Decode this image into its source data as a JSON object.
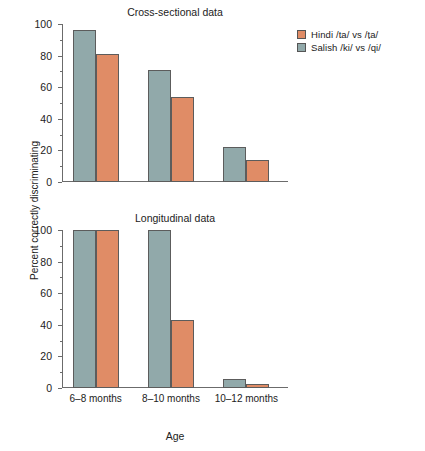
{
  "figure": {
    "ylabel": "Percent correctly discriminating",
    "xlabel": "Age"
  },
  "legend": {
    "position": "top-right",
    "items": [
      {
        "label": "Hindi /ta/ vs /ṭa/",
        "color": "#e08c66",
        "name": "hindi"
      },
      {
        "label": "Salish /ki/ vs /qi/",
        "color": "#91a9aa",
        "name": "salish"
      }
    ]
  },
  "chart_data": [
    {
      "type": "bar",
      "title": "Cross-sectional data",
      "categories": [
        "6–8 months",
        "8–10 months",
        "10–12 months"
      ],
      "series": [
        {
          "name": "Salish /ki/ vs /qi/",
          "color": "#91a9aa",
          "values": [
            96,
            71,
            22
          ]
        },
        {
          "name": "Hindi /ta/ vs /ṭa/",
          "color": "#e08c66",
          "values": [
            81,
            54,
            14
          ]
        }
      ],
      "xlabel": "Age",
      "ylabel": "Percent correctly discriminating",
      "ylim": [
        0,
        100
      ],
      "yticks": [
        0,
        20,
        40,
        60,
        80,
        100
      ],
      "yticks_minor": [
        10,
        30,
        50,
        70,
        90
      ],
      "grid": false
    },
    {
      "type": "bar",
      "title": "Longitudinal data",
      "categories": [
        "6–8 months",
        "8–10 months",
        "10–12 months"
      ],
      "series": [
        {
          "name": "Salish /ki/ vs /qi/",
          "color": "#91a9aa",
          "values": [
            100,
            100,
            6
          ]
        },
        {
          "name": "Hindi /ta/ vs /ṭa/",
          "color": "#e08c66",
          "values": [
            100,
            43,
            2.5
          ]
        }
      ],
      "xlabel": "Age",
      "ylabel": "Percent correctly discriminating",
      "ylim": [
        0,
        100
      ],
      "yticks": [
        0,
        20,
        40,
        60,
        80,
        100
      ],
      "yticks_minor": [
        10,
        30,
        50,
        70,
        90
      ],
      "grid": false
    }
  ]
}
